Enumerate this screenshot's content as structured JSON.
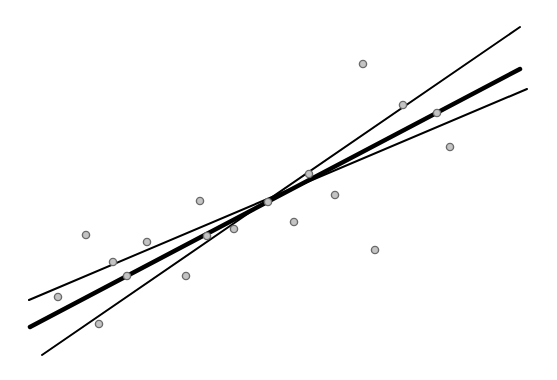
{
  "chart_data": {
    "type": "scatter",
    "title": "",
    "xlabel": "",
    "ylabel": "",
    "grid": false,
    "axes_visible": false,
    "legend": null,
    "canvas": {
      "width": 557,
      "height": 380
    },
    "points": [
      {
        "x": 58,
        "y": 297
      },
      {
        "x": 99,
        "y": 324
      },
      {
        "x": 86,
        "y": 235
      },
      {
        "x": 113,
        "y": 262
      },
      {
        "x": 127,
        "y": 276
      },
      {
        "x": 147,
        "y": 242
      },
      {
        "x": 186,
        "y": 276
      },
      {
        "x": 200,
        "y": 201
      },
      {
        "x": 207,
        "y": 236
      },
      {
        "x": 234,
        "y": 229
      },
      {
        "x": 268,
        "y": 202
      },
      {
        "x": 294,
        "y": 222
      },
      {
        "x": 309,
        "y": 174
      },
      {
        "x": 335,
        "y": 195
      },
      {
        "x": 363,
        "y": 64
      },
      {
        "x": 375,
        "y": 250
      },
      {
        "x": 403,
        "y": 105
      },
      {
        "x": 437,
        "y": 113
      },
      {
        "x": 450,
        "y": 147
      }
    ],
    "series": [
      {
        "name": "fit-line",
        "x1": 30,
        "y1": 327,
        "x2": 520,
        "y2": 69,
        "stroke_width": 4.5
      },
      {
        "name": "steep-bound-line",
        "x1": 42,
        "y1": 355,
        "x2": 520,
        "y2": 27,
        "stroke_width": 2
      },
      {
        "name": "shallow-bound-line",
        "x1": 29,
        "y1": 300,
        "x2": 527,
        "y2": 89,
        "stroke_width": 2
      }
    ],
    "styles": {
      "line_color": "#000000",
      "marker_fill": "#c4c4c4",
      "marker_stroke": "#6a6a6a",
      "marker_radius": 3.6,
      "background": "#ffffff"
    }
  }
}
